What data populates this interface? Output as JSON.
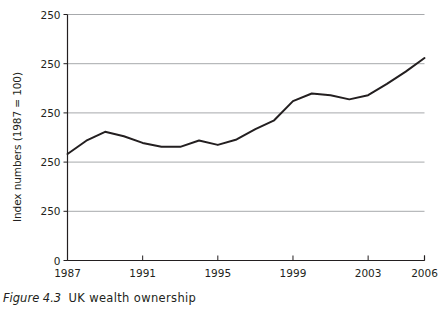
{
  "caption": {
    "figure_number": "Figure 4.3",
    "title": "UK wealth ownership"
  },
  "chart_data": {
    "type": "line",
    "title": "UK wealth ownership",
    "xlabel": "",
    "ylabel": "Index numbers (1987 = 100)",
    "grid": true,
    "legend": false,
    "xlim": [
      1987,
      2006
    ],
    "ylim": [
      0,
      1
    ],
    "x_tick_labels": [
      "1987",
      "1991",
      "1995",
      "1999",
      "2003",
      "2006"
    ],
    "x_tick_values": [
      1987,
      1991,
      1995,
      1999,
      2003,
      2006
    ],
    "y_tick_labels": [
      "250",
      "250",
      "250",
      "250",
      "250",
      "0"
    ],
    "y_tick_positions": [
      1.0,
      0.8,
      0.6,
      0.4,
      0.2,
      0.0
    ],
    "x": [
      1987,
      1988,
      1989,
      1990,
      1991,
      1992,
      1993,
      1994,
      1995,
      1996,
      1997,
      1998,
      1999,
      2000,
      2001,
      2002,
      2003,
      2004,
      2005,
      2006
    ],
    "values": [
      0.433,
      0.487,
      0.523,
      0.505,
      0.478,
      0.462,
      0.462,
      0.488,
      0.47,
      0.492,
      0.534,
      0.57,
      0.648,
      0.679,
      0.672,
      0.655,
      0.672,
      0.718,
      0.768,
      0.823
    ],
    "series": [
      {
        "name": "UK wealth ownership index",
        "color": "#231f20",
        "values": [
          0.433,
          0.487,
          0.523,
          0.505,
          0.478,
          0.462,
          0.462,
          0.488,
          0.47,
          0.492,
          0.534,
          0.57,
          0.648,
          0.679,
          0.672,
          0.655,
          0.672,
          0.718,
          0.768,
          0.823
        ]
      }
    ]
  },
  "style": {
    "line_color": "#231f20",
    "axis_color": "#231f20",
    "grid_color": "#a7a9ac",
    "background": "#ffffff"
  }
}
